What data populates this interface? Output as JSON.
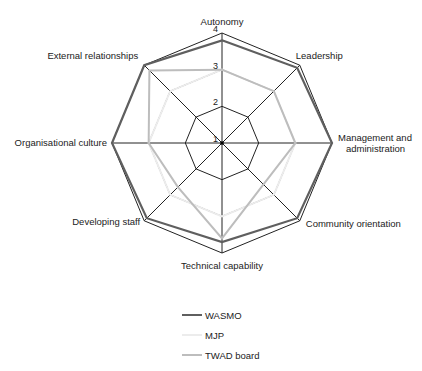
{
  "chart_data": {
    "type": "radar",
    "title": "",
    "axes": [
      "Autonomy",
      "Leadership",
      "Management and administration",
      "Community orientation",
      "Technical capability",
      "Developing staff",
      "Organisational culture",
      "External relationships"
    ],
    "axis_label_lines": [
      [
        "Autonomy"
      ],
      [
        "Leadership"
      ],
      [
        "Management and",
        "administration"
      ],
      [
        "Community orientation"
      ],
      [
        "Technical capability"
      ],
      [
        "Developing staff"
      ],
      [
        "Organisational culture"
      ],
      [
        "External relationships"
      ]
    ],
    "rlim": [
      1,
      4
    ],
    "ticks": [
      1,
      2,
      3,
      4
    ],
    "grid": true,
    "legend_position": "bottom",
    "series": [
      {
        "name": "WASMO",
        "color": "#5f5f5f",
        "width": 2.2,
        "values": [
          3.8,
          3.9,
          4,
          3.9,
          3.7,
          3.9,
          4,
          4
        ]
      },
      {
        "name": "MJP",
        "color": "#ececec",
        "width": 2,
        "values": [
          3,
          3,
          3,
          3,
          3,
          3,
          3,
          3
        ]
      },
      {
        "name": "TWAD board",
        "color": "#bdbdbd",
        "width": 2,
        "values": [
          3,
          3,
          3,
          2.6,
          3.6,
          2.7,
          3,
          3.8
        ]
      }
    ]
  },
  "legend": {
    "items": [
      {
        "label": "WASMO",
        "color": "#5f5f5f"
      },
      {
        "label": "MJP",
        "color": "#ececec"
      },
      {
        "label": "TWAD board",
        "color": "#bdbdbd"
      }
    ]
  }
}
